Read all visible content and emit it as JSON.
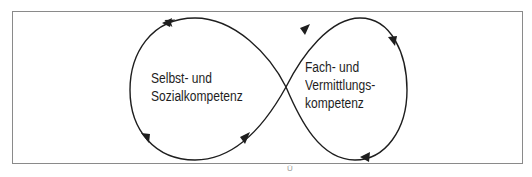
{
  "diagram": {
    "type": "infinity-loop",
    "left_loop": {
      "lines": [
        "Selbst- und",
        "Sozialkompetenz"
      ]
    },
    "right_loop": {
      "lines": [
        "Fach- und",
        "Vermittlungs-",
        "kompetenz"
      ]
    },
    "bottom_artifact": "Ü",
    "colors": {
      "stroke": "#1e1e1e",
      "frame": "#8a8a8a",
      "background": "#ffffff"
    }
  }
}
